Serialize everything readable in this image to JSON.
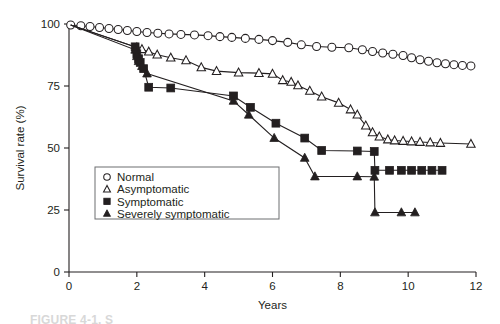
{
  "figure": {
    "caption": "FIGURE 4-1. S",
    "background_color": "#ffffff",
    "ink_color": "#231f20"
  },
  "chart_data": {
    "type": "line",
    "title": "",
    "subtitle": "",
    "xlabel": "Years",
    "ylabel": "Survival rate (%)",
    "xlim": [
      0,
      12
    ],
    "ylim": [
      0,
      100
    ],
    "xticks": [
      0,
      2,
      4,
      6,
      8,
      10,
      12
    ],
    "xtick_labels": [
      "0",
      "2",
      "4",
      "6",
      "8",
      "10",
      "12"
    ],
    "yticks": [
      0,
      25,
      50,
      75,
      100
    ],
    "ytick_labels": [
      "0",
      "25",
      "50",
      "75",
      "100"
    ],
    "grid": false,
    "legend_position": "center-left",
    "series": [
      {
        "name": "Normal",
        "marker": "open-circle",
        "marker_fill": "#ffffff",
        "marker_stroke": "#231f20",
        "points": [
          [
            0.05,
            99.6
          ],
          [
            0.35,
            99.3
          ],
          [
            0.62,
            99.0
          ],
          [
            0.9,
            98.6
          ],
          [
            1.18,
            98.2
          ],
          [
            1.45,
            97.8
          ],
          [
            1.72,
            97.4
          ],
          [
            2.0,
            97.0
          ],
          [
            2.3,
            96.6
          ],
          [
            2.62,
            96.3
          ],
          [
            2.95,
            96.0
          ],
          [
            3.3,
            95.8
          ],
          [
            3.7,
            95.6
          ],
          [
            4.1,
            95.3
          ],
          [
            4.45,
            94.9
          ],
          [
            4.8,
            94.6
          ],
          [
            5.2,
            94.2
          ],
          [
            5.6,
            93.8
          ],
          [
            6.0,
            93.3
          ],
          [
            6.45,
            92.6
          ],
          [
            6.85,
            91.6
          ],
          [
            7.3,
            90.9
          ],
          [
            7.75,
            90.6
          ],
          [
            8.25,
            90.4
          ],
          [
            8.65,
            89.6
          ],
          [
            8.95,
            88.9
          ],
          [
            9.25,
            88.3
          ],
          [
            9.55,
            87.8
          ],
          [
            9.85,
            87.3
          ],
          [
            10.1,
            86.4
          ],
          [
            10.35,
            85.6
          ],
          [
            10.6,
            85.0
          ],
          [
            10.85,
            84.4
          ],
          [
            11.1,
            84.0
          ],
          [
            11.35,
            83.6
          ],
          [
            11.6,
            83.3
          ],
          [
            11.85,
            83.1
          ]
        ]
      },
      {
        "name": "Asymptomatic",
        "marker": "open-triangle",
        "marker_fill": "#ffffff",
        "marker_stroke": "#231f20",
        "points": [
          [
            0.05,
            99.6
          ],
          [
            2.0,
            90.5
          ],
          [
            2.15,
            89.8
          ],
          [
            2.35,
            88.8
          ],
          [
            2.6,
            87.6
          ],
          [
            3.0,
            86.4
          ],
          [
            3.45,
            85.3
          ],
          [
            3.9,
            82.5
          ],
          [
            4.35,
            81.0
          ],
          [
            5.0,
            80.4
          ],
          [
            5.6,
            80.2
          ],
          [
            6.0,
            79.9
          ],
          [
            6.3,
            77.3
          ],
          [
            6.55,
            76.6
          ],
          [
            6.75,
            75.2
          ],
          [
            7.1,
            73.0
          ],
          [
            7.45,
            70.7
          ],
          [
            7.95,
            68.2
          ],
          [
            8.3,
            65.5
          ],
          [
            8.5,
            63.4
          ],
          [
            8.75,
            59.0
          ],
          [
            8.95,
            56.3
          ],
          [
            9.15,
            54.6
          ],
          [
            9.4,
            53.4
          ],
          [
            9.6,
            53.0
          ],
          [
            9.85,
            52.8
          ],
          [
            10.1,
            52.6
          ],
          [
            10.35,
            52.4
          ],
          [
            10.65,
            52.2
          ],
          [
            10.95,
            52.0
          ],
          [
            11.85,
            51.6
          ]
        ]
      },
      {
        "name": "Symptomatic",
        "marker": "filled-square",
        "marker_fill": "#231f20",
        "marker_stroke": "#231f20",
        "points": [
          [
            0.05,
            99.6
          ],
          [
            1.95,
            90.8
          ],
          [
            2.0,
            88.0
          ],
          [
            2.05,
            86.0
          ],
          [
            2.1,
            84.5
          ],
          [
            2.2,
            82.0
          ],
          [
            2.35,
            74.5
          ],
          [
            3.0,
            74.2
          ],
          [
            4.85,
            71.0
          ],
          [
            5.35,
            66.4
          ],
          [
            6.1,
            60.0
          ],
          [
            6.95,
            54.0
          ],
          [
            7.45,
            49.0
          ],
          [
            8.5,
            48.8
          ],
          [
            9.0,
            48.6
          ],
          [
            9.02,
            41.0
          ],
          [
            9.45,
            41.0
          ],
          [
            9.8,
            41.0
          ],
          [
            10.1,
            41.0
          ],
          [
            10.4,
            41.0
          ],
          [
            10.7,
            41.0
          ],
          [
            11.0,
            41.0
          ]
        ]
      },
      {
        "name": "Severely symptomatic",
        "marker": "filled-triangle",
        "marker_fill": "#231f20",
        "marker_stroke": "#231f20",
        "points": [
          [
            0.05,
            99.6
          ],
          [
            1.95,
            89.6
          ],
          [
            2.0,
            87.0
          ],
          [
            2.05,
            85.0
          ],
          [
            2.15,
            83.0
          ],
          [
            2.3,
            80.0
          ],
          [
            4.85,
            69.0
          ],
          [
            5.3,
            63.4
          ],
          [
            6.05,
            54.0
          ],
          [
            6.95,
            46.0
          ],
          [
            7.25,
            38.5
          ],
          [
            8.5,
            38.5
          ],
          [
            9.0,
            38.4
          ],
          [
            9.02,
            24.0
          ],
          [
            9.8,
            24.0
          ],
          [
            10.2,
            24.0
          ]
        ]
      }
    ],
    "legend_entries": [
      {
        "label": "Normal",
        "marker": "open-circle"
      },
      {
        "label": "Asymptomatic",
        "marker": "open-triangle"
      },
      {
        "label": "Symptomatic",
        "marker": "filled-square"
      },
      {
        "label": "Severely symptomatic",
        "marker": "filled-triangle"
      }
    ]
  }
}
